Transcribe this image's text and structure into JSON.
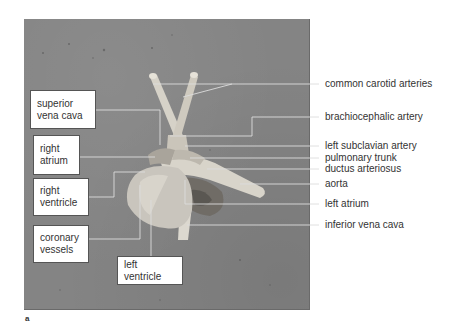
{
  "figure": {
    "letter": "a",
    "photo_background_color": "#848484",
    "leader_line_color": "#d8d8d8"
  },
  "left_labels": [
    {
      "id": "superior-vena-cava",
      "line1": "superior",
      "line2": "vena cava"
    },
    {
      "id": "right-atrium",
      "line1": "right",
      "line2": "atrium"
    },
    {
      "id": "right-ventricle",
      "line1": "right",
      "line2": "ventricle"
    },
    {
      "id": "coronary-vessels",
      "line1": "coronary",
      "line2": "vessels"
    }
  ],
  "bottom_label": {
    "id": "left-ventricle",
    "text": "left ventricle"
  },
  "right_labels": [
    {
      "id": "common-carotid-arteries",
      "text": "common carotid arteries"
    },
    {
      "id": "brachiocephalic-artery",
      "text": "brachiocephalic artery"
    },
    {
      "id": "left-subclavian-artery",
      "text": "left subclavian artery"
    },
    {
      "id": "pulmonary-trunk",
      "text": "pulmonary trunk"
    },
    {
      "id": "ductus-arteriosus",
      "text": "ductus arteriosus"
    },
    {
      "id": "aorta",
      "text": "aorta"
    },
    {
      "id": "left-atrium",
      "text": "left atrium"
    },
    {
      "id": "inferior-vena-cava",
      "text": "inferior vena cava"
    }
  ]
}
